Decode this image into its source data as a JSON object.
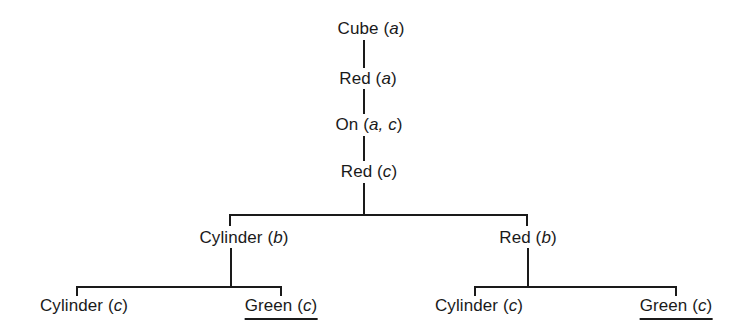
{
  "diagram": {
    "type": "tree",
    "nodes": [
      {
        "id": "n1",
        "predicate": "Cube",
        "open": " (",
        "args": "a",
        "close": ")",
        "underlined": false
      },
      {
        "id": "n2",
        "predicate": "Red",
        "open": " (",
        "args": "a",
        "close": ")",
        "underlined": false
      },
      {
        "id": "n3",
        "predicate": "On",
        "open": " (",
        "args": "a, c",
        "close": ")",
        "underlined": false
      },
      {
        "id": "n4",
        "predicate": "Red",
        "open": " (",
        "args": "c",
        "close": ")",
        "underlined": false
      },
      {
        "id": "n5",
        "predicate": "Cylinder",
        "open": " (",
        "args": "b",
        "close": ")",
        "underlined": false
      },
      {
        "id": "n6",
        "predicate": "Red",
        "open": " (",
        "args": "b",
        "close": ")",
        "underlined": false
      },
      {
        "id": "n7",
        "predicate": "Cylinder",
        "open": " (",
        "args": "c",
        "close": ")",
        "underlined": false
      },
      {
        "id": "n8",
        "predicate": "Green",
        "open": " (",
        "args": "c",
        "close": ")",
        "underlined": true
      },
      {
        "id": "n9",
        "predicate": "Cylinder",
        "open": " (",
        "args": "c",
        "close": ")",
        "underlined": false
      },
      {
        "id": "n10",
        "predicate": "Green",
        "open": " (",
        "args": "c",
        "close": ")",
        "underlined": true
      }
    ],
    "edges": [
      [
        "n1",
        "n2"
      ],
      [
        "n2",
        "n3"
      ],
      [
        "n3",
        "n4"
      ],
      [
        "n4",
        "n5"
      ],
      [
        "n4",
        "n6"
      ],
      [
        "n5",
        "n7"
      ],
      [
        "n5",
        "n8"
      ],
      [
        "n6",
        "n9"
      ],
      [
        "n6",
        "n10"
      ]
    ],
    "line_color": "#1a1a1a"
  }
}
